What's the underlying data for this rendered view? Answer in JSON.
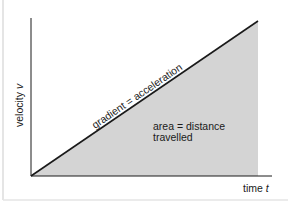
{
  "diagram": {
    "type": "velocity-time graph",
    "y_axis_label": "velocity",
    "y_axis_symbol": "v",
    "x_axis_label": "time",
    "x_axis_symbol": "t",
    "line_annotation": "gradient = acceleration",
    "area_annotation_line1": "area = distance",
    "area_annotation_line2": "travelled",
    "colors": {
      "background": "#ffffff",
      "axis": "#1a1a1a",
      "line": "#1a1a1a",
      "area_fill": "#d4d4d4",
      "frame": "#d8d8d8"
    }
  }
}
